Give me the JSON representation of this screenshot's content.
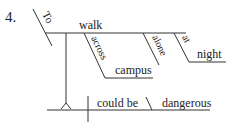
{
  "diagram": {
    "number": "4.",
    "subject": {
      "introductory": "To",
      "verb": "walk",
      "modifiers": {
        "prep1": "across",
        "prep1_object": "campus",
        "adverb": "alone",
        "prep2": "at",
        "prep2_object": "night"
      }
    },
    "predicate": {
      "verb": "could be",
      "complement": "dangerous"
    }
  }
}
